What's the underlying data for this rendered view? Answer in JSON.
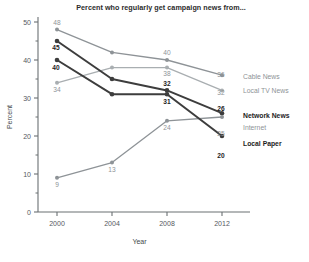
{
  "chart_data": {
    "type": "line",
    "title": "Percent who regularly get campaign news from...",
    "xlabel": "Year",
    "ylabel": "Percent",
    "categories": [
      "2000",
      "2004",
      "2008",
      "2012"
    ],
    "x": [
      2000,
      2004,
      2008,
      2012
    ],
    "ylim": [
      0,
      50
    ],
    "xlim": [
      1998,
      2013.5
    ],
    "yticks": [
      "0",
      "10",
      "20",
      "30",
      "40",
      "50"
    ],
    "ytick_values": [
      0,
      10,
      20,
      30,
      40,
      50
    ],
    "yminor": [
      5,
      15,
      25,
      35,
      45
    ],
    "grid": false,
    "legend_position": "right-of-plot-endpoints",
    "series": [
      {
        "name": "Cable News",
        "values": [
          48,
          42,
          40,
          36
        ],
        "color": "#8e9397",
        "emphasis": "gray",
        "end_label": "36",
        "point_labels": [
          "48",
          "",
          "40",
          ""
        ]
      },
      {
        "name": "Local TV News",
        "values": [
          34,
          38,
          38,
          32
        ],
        "color": "#a9aeb1",
        "emphasis": "gray",
        "end_label": "32",
        "point_labels": [
          "34",
          "",
          "38",
          ""
        ]
      },
      {
        "name": "Network News",
        "values": [
          45,
          35,
          32,
          26
        ],
        "color": "#3d3d3d",
        "emphasis": "bold",
        "end_label": "26",
        "point_labels": [
          "45",
          "",
          "32",
          ""
        ]
      },
      {
        "name": "Internet",
        "values": [
          9,
          13,
          24,
          25
        ],
        "color": "#8e9397",
        "emphasis": "gray",
        "end_label": "25",
        "point_labels": [
          "9",
          "13",
          "24",
          ""
        ]
      },
      {
        "name": "Local Paper",
        "values": [
          40,
          31,
          31,
          20
        ],
        "color": "#3d3d3d",
        "emphasis": "bold",
        "end_label": "20",
        "point_labels": [
          "40",
          "",
          "31",
          ""
        ]
      }
    ]
  },
  "colors": {
    "axis": "#6b7073",
    "gray_series": "#8e9397",
    "light_gray_series": "#a9aeb1",
    "dark_series": "#3d3d3d",
    "text_dark": "#1d1d1d",
    "text_gray": "#8e9397",
    "background": "#ffffff"
  }
}
